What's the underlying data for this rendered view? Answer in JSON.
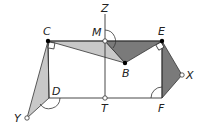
{
  "diagram": {
    "type": "geometry-figure",
    "points": {
      "C": {
        "label": "C",
        "x": 48,
        "y": 41,
        "marker": "filled"
      },
      "M": {
        "label": "M",
        "x": 105,
        "y": 41,
        "marker": "open"
      },
      "E": {
        "label": "E",
        "x": 162,
        "y": 41,
        "marker": "filled"
      },
      "B": {
        "label": "B",
        "x": 125,
        "y": 63,
        "marker": "filled"
      },
      "D": {
        "label": "D",
        "x": 49,
        "y": 98,
        "marker": "none"
      },
      "T": {
        "label": "T",
        "x": 105,
        "y": 98,
        "marker": "open"
      },
      "F": {
        "label": "F",
        "x": 162,
        "y": 98,
        "marker": "none"
      },
      "Y": {
        "label": "Y",
        "x": 27,
        "y": 118,
        "marker": "open"
      },
      "X": {
        "label": "X",
        "x": 182,
        "y": 75,
        "marker": "open"
      },
      "Z": {
        "label": "Z",
        "x": 105,
        "y": 10,
        "marker": "none"
      }
    },
    "shaded_regions": [
      {
        "name": "triangle-CMB",
        "vertices": [
          "C",
          "M",
          "B"
        ],
        "fill": "#c8c8c8"
      },
      {
        "name": "triangle-MEB",
        "vertices": [
          "M",
          "E",
          "B"
        ],
        "fill": "#7a7a7a"
      },
      {
        "name": "triangle-CDY",
        "vertices": [
          "C",
          "D",
          "Y"
        ],
        "fill": "#c8c8c8"
      },
      {
        "name": "triangle-EFX",
        "vertices": [
          "E",
          "F",
          "X"
        ],
        "fill": "#7a7a7a"
      }
    ],
    "segments": [
      "CE",
      "CD",
      "DF",
      "EF",
      "MZ",
      "MT",
      "CB",
      "BE",
      "MB",
      "CY",
      "DY",
      "EX",
      "FX"
    ],
    "right_angle_marks": [
      "C",
      "E"
    ],
    "angle_arcs": [
      "M",
      "D",
      "F"
    ]
  }
}
